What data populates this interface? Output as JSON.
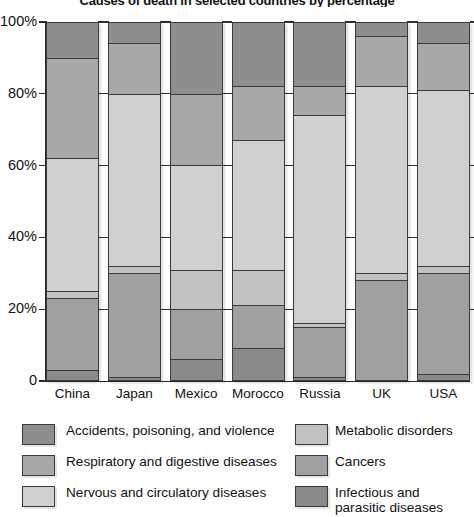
{
  "chart_data": {
    "type": "bar",
    "subtype": "stacked-percentage",
    "title": "Causes of death in selected countries by percentage",
    "xlabel": "",
    "ylabel": "",
    "ylim": [
      0,
      100
    ],
    "ytick_labels": [
      "0",
      "20%",
      "40%",
      "60%",
      "80%",
      "100%"
    ],
    "ytick_values": [
      0,
      20,
      40,
      60,
      80,
      100
    ],
    "grid": true,
    "legend_position": "bottom",
    "categories": [
      "China",
      "Japan",
      "Mexico",
      "Morocco",
      "Russia",
      "UK",
      "USA"
    ],
    "stack_order_top_to_bottom": [
      "Accidents, poisoning, and violence",
      "Respiratory and digestive diseases",
      "Nervous and circulatory diseases",
      "Metabolic disorders",
      "Cancers",
      "Infectious and parasitic diseases"
    ],
    "series": [
      {
        "name": "Accidents, poisoning, and violence",
        "color": "#8e8e8e",
        "values": [
          10,
          6,
          20,
          18,
          18,
          4,
          6
        ]
      },
      {
        "name": "Respiratory and digestive diseases",
        "color": "#a8a8a8",
        "values": [
          28,
          14,
          20,
          15,
          8,
          14,
          13
        ]
      },
      {
        "name": "Nervous and circulatory diseases",
        "color": "#d0d0d0",
        "values": [
          37,
          48,
          29,
          36,
          58,
          52,
          49
        ]
      },
      {
        "name": "Metabolic disorders",
        "color": "#c2c2c2",
        "values": [
          2,
          2,
          11,
          10,
          1,
          2,
          2
        ]
      },
      {
        "name": "Cancers",
        "color": "#a0a0a0",
        "values": [
          20,
          29,
          14,
          12,
          14,
          28,
          28
        ]
      },
      {
        "name": "Infectious and parasitic diseases",
        "color": "#8a8a8a",
        "values": [
          3,
          1,
          6,
          9,
          1,
          0,
          2
        ]
      }
    ]
  },
  "legend": {
    "left_column": [
      {
        "label": "Accidents, poisoning, and violence",
        "color": "#8e8e8e",
        "swatch": "legend-swatch-accidents"
      },
      {
        "label": "Respiratory and digestive diseases",
        "color": "#a8a8a8",
        "swatch": "legend-swatch-respiratory"
      },
      {
        "label": "Nervous and circulatory diseases",
        "color": "#d0d0d0",
        "swatch": "legend-swatch-nervous"
      }
    ],
    "right_column": [
      {
        "label": "Metabolic disorders",
        "color": "#c2c2c2",
        "swatch": "legend-swatch-metabolic"
      },
      {
        "label": "Cancers",
        "color": "#a0a0a0",
        "swatch": "legend-swatch-cancers"
      },
      {
        "label": "Infectious and\nparasitic diseases",
        "color": "#8a8a8a",
        "swatch": "legend-swatch-infectious"
      }
    ]
  },
  "colors": {
    "axis": "#2a2a2a",
    "text": "#111111",
    "background": "#ffffff",
    "bar_outline": "#3a3a3a"
  }
}
